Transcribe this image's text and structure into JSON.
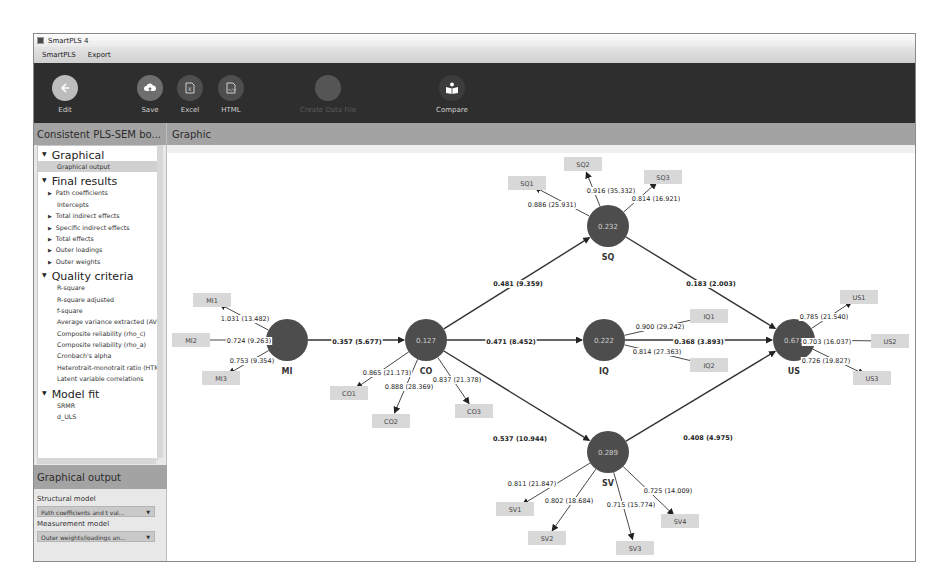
{
  "window": {
    "title": "SmartPLS 4"
  },
  "menu": [
    "SmartPLS",
    "Export"
  ],
  "toolbar": {
    "buttons": [
      {
        "label": "Edit",
        "icon": "arrow-left-icon",
        "enabled": true
      },
      {
        "label": "Save",
        "icon": "cloud-upload-icon",
        "enabled": true
      },
      {
        "label": "Excel",
        "icon": "excel-file-icon",
        "enabled": true
      },
      {
        "label": "HTML",
        "icon": "html-file-icon",
        "enabled": true
      },
      {
        "label": "Create Data File",
        "icon": "create-file-icon",
        "enabled": false
      },
      {
        "label": "Compare",
        "icon": "compare-icon",
        "enabled": true
      }
    ]
  },
  "sidebar": {
    "title": "Consistent PLS-SEM bo...",
    "sections": [
      {
        "label": "Graphical",
        "items": [
          {
            "label": "Graphical output",
            "expandable": false,
            "selected": true
          }
        ]
      },
      {
        "label": "Final results",
        "items": [
          {
            "label": "Path coefficients",
            "expandable": true
          },
          {
            "label": "Intercepts",
            "expandable": false
          },
          {
            "label": "Total indirect effects",
            "expandable": true
          },
          {
            "label": "Specific indirect effects",
            "expandable": true
          },
          {
            "label": "Total effects",
            "expandable": true
          },
          {
            "label": "Outer loadings",
            "expandable": true
          },
          {
            "label": "Outer weights",
            "expandable": true
          }
        ]
      },
      {
        "label": "Quality criteria",
        "items": [
          {
            "label": "R-square",
            "expandable": false
          },
          {
            "label": "R-square adjusted",
            "expandable": false
          },
          {
            "label": "f-square",
            "expandable": false
          },
          {
            "label": "Average variance extracted (AVE)",
            "expandable": false
          },
          {
            "label": "Composite reliability (rho_c)",
            "expandable": false
          },
          {
            "label": "Composite reliability (rho_a)",
            "expandable": false
          },
          {
            "label": "Cronbach's alpha",
            "expandable": false
          },
          {
            "label": "Heterotrait-monotrait ratio (HTMT)",
            "expandable": false
          },
          {
            "label": "Latent variable correlations",
            "expandable": false
          }
        ]
      },
      {
        "label": "Model fit",
        "items": [
          {
            "label": "SRMR",
            "expandable": false
          },
          {
            "label": "d_ULS",
            "expandable": false
          }
        ]
      }
    ]
  },
  "graphical_output": {
    "title": "Graphical output",
    "structural_label": "Structural model",
    "structural_value": "Path coefficients and t val...",
    "measurement_label": "Measurement model",
    "measurement_value": "Outer weights/loadings an..."
  },
  "main": {
    "title": "Graphic"
  },
  "model": {
    "colors": {
      "construct": "#4d4d4d",
      "indicator": "#d8d8d8",
      "line": "#333333"
    },
    "constructs": [
      {
        "id": "MI",
        "label": "MI",
        "r2": ""
      },
      {
        "id": "CO",
        "label": "CO",
        "r2": "0.127"
      },
      {
        "id": "SQ",
        "label": "SQ",
        "r2": "0.232"
      },
      {
        "id": "IQ",
        "label": "IQ",
        "r2": "0.222"
      },
      {
        "id": "SV",
        "label": "SV",
        "r2": "0.289"
      },
      {
        "id": "US",
        "label": "US",
        "r2": "0.671"
      }
    ],
    "paths": [
      {
        "from": "MI",
        "to": "CO",
        "label": "0.357 (5.677)"
      },
      {
        "from": "CO",
        "to": "SQ",
        "label": "0.481 (9.359)"
      },
      {
        "from": "CO",
        "to": "IQ",
        "label": "0.471 (8.452)"
      },
      {
        "from": "CO",
        "to": "SV",
        "label": "0.537 (10.944)"
      },
      {
        "from": "SQ",
        "to": "US",
        "label": "0.183 (2.003)"
      },
      {
        "from": "IQ",
        "to": "US",
        "label": "0.368 (3.893)"
      },
      {
        "from": "SV",
        "to": "US",
        "label": "0.408 (4.975)"
      }
    ],
    "indicators": [
      {
        "id": "MI1",
        "construct": "MI",
        "label": "1.031 (13.482)"
      },
      {
        "id": "MI2",
        "construct": "MI",
        "label": "0.724 (9.263)"
      },
      {
        "id": "MI3",
        "construct": "MI",
        "label": "0.753 (9.354)"
      },
      {
        "id": "CO1",
        "construct": "CO",
        "label": "0.865 (21.173)"
      },
      {
        "id": "CO2",
        "construct": "CO",
        "label": "0.888 (28.369)"
      },
      {
        "id": "CO3",
        "construct": "CO",
        "label": "0.837 (21.378)"
      },
      {
        "id": "SQ1",
        "construct": "SQ",
        "label": "0.886 (25.931)"
      },
      {
        "id": "SQ2",
        "construct": "SQ",
        "label": "0.916 (35.332)"
      },
      {
        "id": "SQ3",
        "construct": "SQ",
        "label": "0.814 (16.921)"
      },
      {
        "id": "IQ1",
        "construct": "IQ",
        "label": "0.900 (29.242)"
      },
      {
        "id": "IQ2",
        "construct": "IQ",
        "label": "0.814 (27.363)"
      },
      {
        "id": "SV1",
        "construct": "SV",
        "label": "0.811 (21.847)"
      },
      {
        "id": "SV2",
        "construct": "SV",
        "label": "0.802 (18.684)"
      },
      {
        "id": "SV3",
        "construct": "SV",
        "label": "0.715 (15.774)"
      },
      {
        "id": "SV4",
        "construct": "SV",
        "label": "0.725 (14.009)"
      },
      {
        "id": "US1",
        "construct": "US",
        "label": "0.785 (21.540)"
      },
      {
        "id": "US2",
        "construct": "US",
        "label": "0.703 (16.037)"
      },
      {
        "id": "US3",
        "construct": "US",
        "label": "0.726 (19.827)"
      }
    ]
  }
}
